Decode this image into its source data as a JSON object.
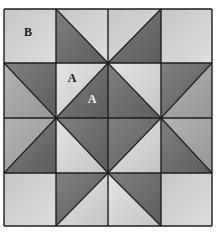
{
  "diagram": {
    "type": "quilt-block",
    "grid": {
      "rows": 4,
      "cols": 4
    },
    "bounds": {
      "x0": 4,
      "y0": 9,
      "x1": 212,
      "y1": 226
    },
    "col_lines": [
      4,
      56,
      108,
      161,
      212
    ],
    "row_lines": [
      9,
      63,
      118,
      173,
      226
    ],
    "colors": {
      "line": "#1e1e1e",
      "light": "#d2d2d2",
      "lighter": "#dcdcdc",
      "medium": "#a8a8a8",
      "dark": "#6e6e6e",
      "label_dark": "#1a1a1a",
      "label_light": "#f2f2f2"
    },
    "cells": [
      {
        "r": 0,
        "c": 0,
        "kind": "square",
        "shade": "light"
      },
      {
        "r": 0,
        "c": 1,
        "kind": "tri",
        "diag": "TL-BR",
        "a": "dark",
        "b": "light"
      },
      {
        "r": 0,
        "c": 2,
        "kind": "tri",
        "diag": "BL-TR",
        "a": "light",
        "b": "dark"
      },
      {
        "r": 0,
        "c": 3,
        "kind": "square",
        "shade": "light"
      },
      {
        "r": 1,
        "c": 0,
        "kind": "tri",
        "diag": "TL-BR",
        "a": "medium",
        "b": "dark"
      },
      {
        "r": 1,
        "c": 1,
        "kind": "tri",
        "diag": "BL-TR",
        "a": "lighter",
        "b": "dark"
      },
      {
        "r": 1,
        "c": 2,
        "kind": "tri",
        "diag": "TL-BR",
        "a": "dark",
        "b": "lighter"
      },
      {
        "r": 1,
        "c": 3,
        "kind": "tri",
        "diag": "BL-TR",
        "a": "dark",
        "b": "medium"
      },
      {
        "r": 2,
        "c": 0,
        "kind": "tri",
        "diag": "BL-TR",
        "a": "medium",
        "b": "dark"
      },
      {
        "r": 2,
        "c": 1,
        "kind": "tri",
        "diag": "TL-BR",
        "a": "lighter",
        "b": "dark"
      },
      {
        "r": 2,
        "c": 2,
        "kind": "tri",
        "diag": "BL-TR",
        "a": "dark",
        "b": "lighter"
      },
      {
        "r": 2,
        "c": 3,
        "kind": "tri",
        "diag": "TL-BR",
        "a": "dark",
        "b": "medium"
      },
      {
        "r": 3,
        "c": 0,
        "kind": "square",
        "shade": "light"
      },
      {
        "r": 3,
        "c": 1,
        "kind": "tri",
        "diag": "BL-TR",
        "a": "dark",
        "b": "lighter"
      },
      {
        "r": 3,
        "c": 2,
        "kind": "tri",
        "diag": "TL-BR",
        "a": "lighter",
        "b": "dark"
      },
      {
        "r": 3,
        "c": 3,
        "kind": "square",
        "shade": "light"
      }
    ],
    "labels": [
      {
        "text": "B",
        "x": 28,
        "y": 36,
        "tone": "dark"
      },
      {
        "text": "A",
        "x": 72,
        "y": 82,
        "tone": "dark"
      },
      {
        "text": "A",
        "x": 92,
        "y": 103,
        "tone": "light"
      }
    ]
  }
}
